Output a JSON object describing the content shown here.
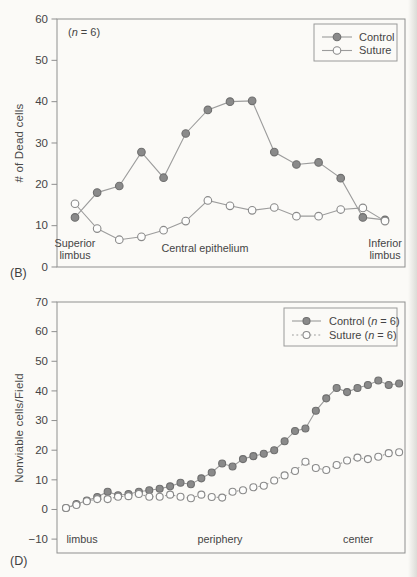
{
  "figure": {
    "panels": [
      "(B)",
      "(D)"
    ],
    "background_color": "#fbfaf7",
    "axis_color": "#8f8f8f",
    "text_color": "#454545"
  },
  "chart_data": [
    {
      "type": "line",
      "panel_label": "(B)",
      "annotation": "(n = 6)",
      "title": "",
      "xlabel": "",
      "ylabel": "# of Dead cells",
      "ylim": [
        0,
        60
      ],
      "yticks": [
        0,
        10,
        20,
        30,
        40,
        50,
        60
      ],
      "grid": false,
      "legend_position": "top-right",
      "x_region_labels": [
        {
          "lines": [
            "Superior",
            "limbus"
          ]
        },
        {
          "lines": [
            "Central epithelium"
          ]
        },
        {
          "lines": [
            "Inferior",
            "limbus"
          ]
        }
      ],
      "series": [
        {
          "name": "Control",
          "legend_label": "Control",
          "line_style": "solid",
          "line_color": "#9c9c9c",
          "marker": "filled-circle",
          "marker_fill": "#8a8a8a",
          "marker_stroke": "#6f6f6f",
          "values": [
            12,
            18,
            19.6,
            27.8,
            21.6,
            32.3,
            38,
            40,
            40.2,
            27.8,
            24.8,
            25.3,
            21.5,
            12,
            11.4
          ]
        },
        {
          "name": "Suture",
          "legend_label": "Suture",
          "line_style": "solid",
          "line_color": "#9c9c9c",
          "marker": "open-circle",
          "marker_fill": "#fdfdfc",
          "marker_stroke": "#8a8a8a",
          "values": [
            15.3,
            9.3,
            6.6,
            7.3,
            8.9,
            11.1,
            16.1,
            14.8,
            13.7,
            14.4,
            12.3,
            12.3,
            13.9,
            14.3,
            11.1
          ]
        }
      ]
    },
    {
      "type": "line",
      "panel_label": "(D)",
      "annotation": "",
      "title": "",
      "xlabel": "",
      "ylabel": "Nonviable cells/Field",
      "ylim": [
        -10,
        70
      ],
      "yticks": [
        -10,
        0,
        10,
        20,
        30,
        40,
        50,
        60,
        70
      ],
      "grid": false,
      "legend_position": "top-right",
      "x_region_labels": [
        {
          "lines": [
            "limbus"
          ]
        },
        {
          "lines": [
            "periphery"
          ]
        },
        {
          "lines": [
            "center"
          ]
        }
      ],
      "series": [
        {
          "name": "Control",
          "legend_label": "Control (n = 6)",
          "line_style": "solid",
          "line_color": "#9c9c9c",
          "marker": "filled-circle",
          "marker_fill": "#8a8a8a",
          "marker_stroke": "#6f6f6f",
          "values": [
            0.5,
            1.8,
            3,
            4.2,
            6,
            4.8,
            5.2,
            6,
            6.5,
            7,
            7.8,
            9,
            8.5,
            10.5,
            12.5,
            15.5,
            14.5,
            17,
            18,
            18.8,
            20,
            23,
            26.5,
            27.3,
            33.3,
            37.5,
            41,
            39.6,
            41,
            42,
            43.5,
            42,
            42.5
          ]
        },
        {
          "name": "Suture",
          "legend_label": "Suture (n = 6)",
          "line_style": "dotted",
          "line_color": "#9c9c9c",
          "marker": "open-circle",
          "marker_fill": "#fdfdfc",
          "marker_stroke": "#8a8a8a",
          "values": [
            0.5,
            1.5,
            2.8,
            3.5,
            3.5,
            4.3,
            4.5,
            5.2,
            4.3,
            4.3,
            5,
            4.3,
            3.8,
            5,
            4.2,
            4,
            6,
            6.5,
            7.5,
            8,
            9.8,
            11.5,
            13,
            16.1,
            14,
            13.3,
            15,
            16.5,
            17.5,
            17,
            17.8,
            19,
            19.3
          ]
        }
      ]
    }
  ]
}
